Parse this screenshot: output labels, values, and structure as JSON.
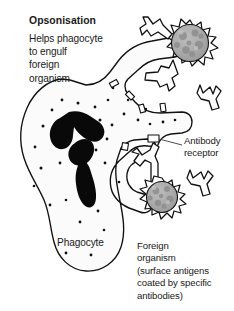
{
  "figure": {
    "kind": "biology-diagram",
    "topic": "Opsonisation",
    "title": "Opsonisation",
    "description_lines": [
      "Helps phagocyte",
      "to engulf",
      "foreign",
      "organism"
    ],
    "description_text": "Helps phagocyte\nto engulf\nforeign\norganism"
  },
  "labels": {
    "antibody_receptor": "Antibody\nreceptor",
    "antibody_receptor_lines": [
      "Antibody",
      "receptor"
    ],
    "phagocyte": "Phagocyte",
    "foreign_organism": "Foreign\norganism\n(surface antigens\ncoated by specific\nantibodies)",
    "foreign_organism_lines": [
      "Foreign",
      "organism",
      "(surface antigens",
      "coated by specific",
      "antibodies)"
    ]
  },
  "icons": {
    "phagocyte_cell": "phagocyte-cell-icon",
    "phagocyte_nucleus": "lobed-nucleus-icon",
    "foreign_organism": "spiky-microbe-icon",
    "antibody": "y-shaped-antibody-icon",
    "receptor": "membrane-receptor-icon",
    "leader_line": "leader-line-icon",
    "granule": "cytoplasm-granule-icon"
  },
  "colors": {
    "background": "#ffffff",
    "ink": "#111111",
    "text": "#1a1a1a",
    "cytoplasm_fill": "#fbfbfb",
    "nucleus_fill": "#090909",
    "microbe_fill": "#a8a8a8",
    "microbe_mottle": "#8f8f8f",
    "antibody_fill": "#ffffff",
    "receptor_fill": "#ffffff",
    "leader_line": "#3a3a3a"
  },
  "counts": {
    "antibodies_on_upper_organism": 2,
    "free_antibodies": 2,
    "antibodies_bound_at_receptor": 1,
    "foreign_organisms": 2,
    "membrane_receptors": 6
  }
}
